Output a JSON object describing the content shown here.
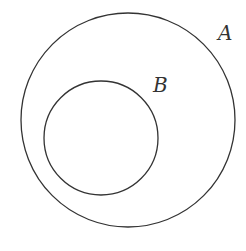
{
  "diagram": {
    "type": "venn-subset",
    "sets": [
      {
        "id": "A",
        "label": "A",
        "circle": {
          "cx": 128,
          "cy": 120,
          "r": 107
        },
        "label_pos": {
          "x": 218,
          "y": 40
        }
      },
      {
        "id": "B",
        "label": "B",
        "circle": {
          "cx": 101,
          "cy": 138,
          "r": 57
        },
        "label_pos": {
          "x": 153,
          "y": 92
        }
      }
    ],
    "relationship": "B ⊂ A"
  },
  "style": {
    "stroke_color": "#333333",
    "background": "#ffffff"
  }
}
